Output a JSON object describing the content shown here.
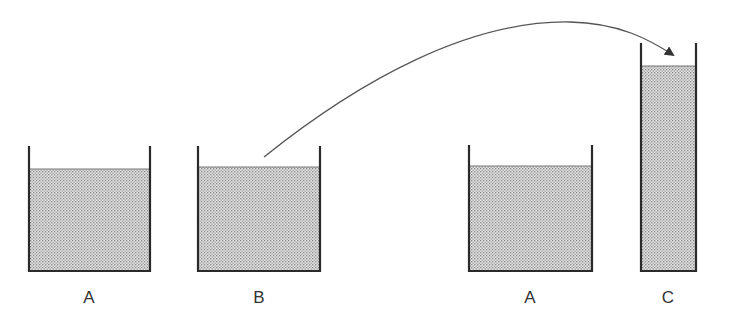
{
  "diagram": {
    "colors": {
      "wall": "#2a2a2a",
      "liquid_fill": "#d4d4d4",
      "liquid_dots": "#8a8a8a",
      "arrow": "#555555",
      "label": "#333333"
    },
    "containers": [
      {
        "id": "A1",
        "label": "A"
      },
      {
        "id": "B",
        "label": "B"
      },
      {
        "id": "A2",
        "label": "A"
      },
      {
        "id": "C",
        "label": "C"
      }
    ],
    "arrow": {
      "from": "B",
      "to": "C",
      "meaning": "pour"
    }
  }
}
